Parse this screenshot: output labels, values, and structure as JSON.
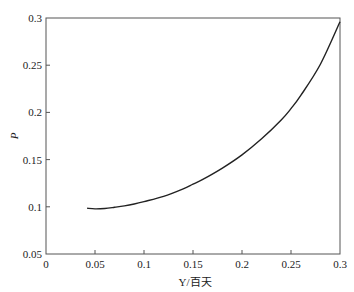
{
  "chart_data": {
    "type": "line",
    "title": "",
    "xlabel": "Y/百天",
    "ylabel": "P",
    "xlim": [
      0,
      0.3
    ],
    "ylim": [
      0.05,
      0.3
    ],
    "grid": false,
    "legend": null,
    "x_ticks": [
      0,
      0.05,
      0.1,
      0.15,
      0.2,
      0.25,
      0.3
    ],
    "x_tick_labels": [
      "0",
      "0.05",
      "0.1",
      "0.15",
      "0.2",
      "0.25",
      "0.3"
    ],
    "y_ticks": [
      0.05,
      0.1,
      0.15,
      0.2,
      0.25,
      0.3
    ],
    "y_tick_labels": [
      "0.05",
      "0.1",
      "0.15",
      "0.2",
      "0.25",
      "0.3"
    ],
    "series": [
      {
        "name": "P",
        "color": "#222222",
        "x": [
          0.042,
          0.05,
          0.06,
          0.07,
          0.08,
          0.09,
          0.1,
          0.12,
          0.14,
          0.15,
          0.16,
          0.18,
          0.2,
          0.22,
          0.24,
          0.25,
          0.26,
          0.28,
          0.3
        ],
        "y": [
          0.0985,
          0.0978,
          0.0982,
          0.0995,
          0.101,
          0.103,
          0.1055,
          0.111,
          0.119,
          0.124,
          0.129,
          0.141,
          0.155,
          0.172,
          0.192,
          0.204,
          0.218,
          0.251,
          0.296
        ]
      }
    ]
  }
}
